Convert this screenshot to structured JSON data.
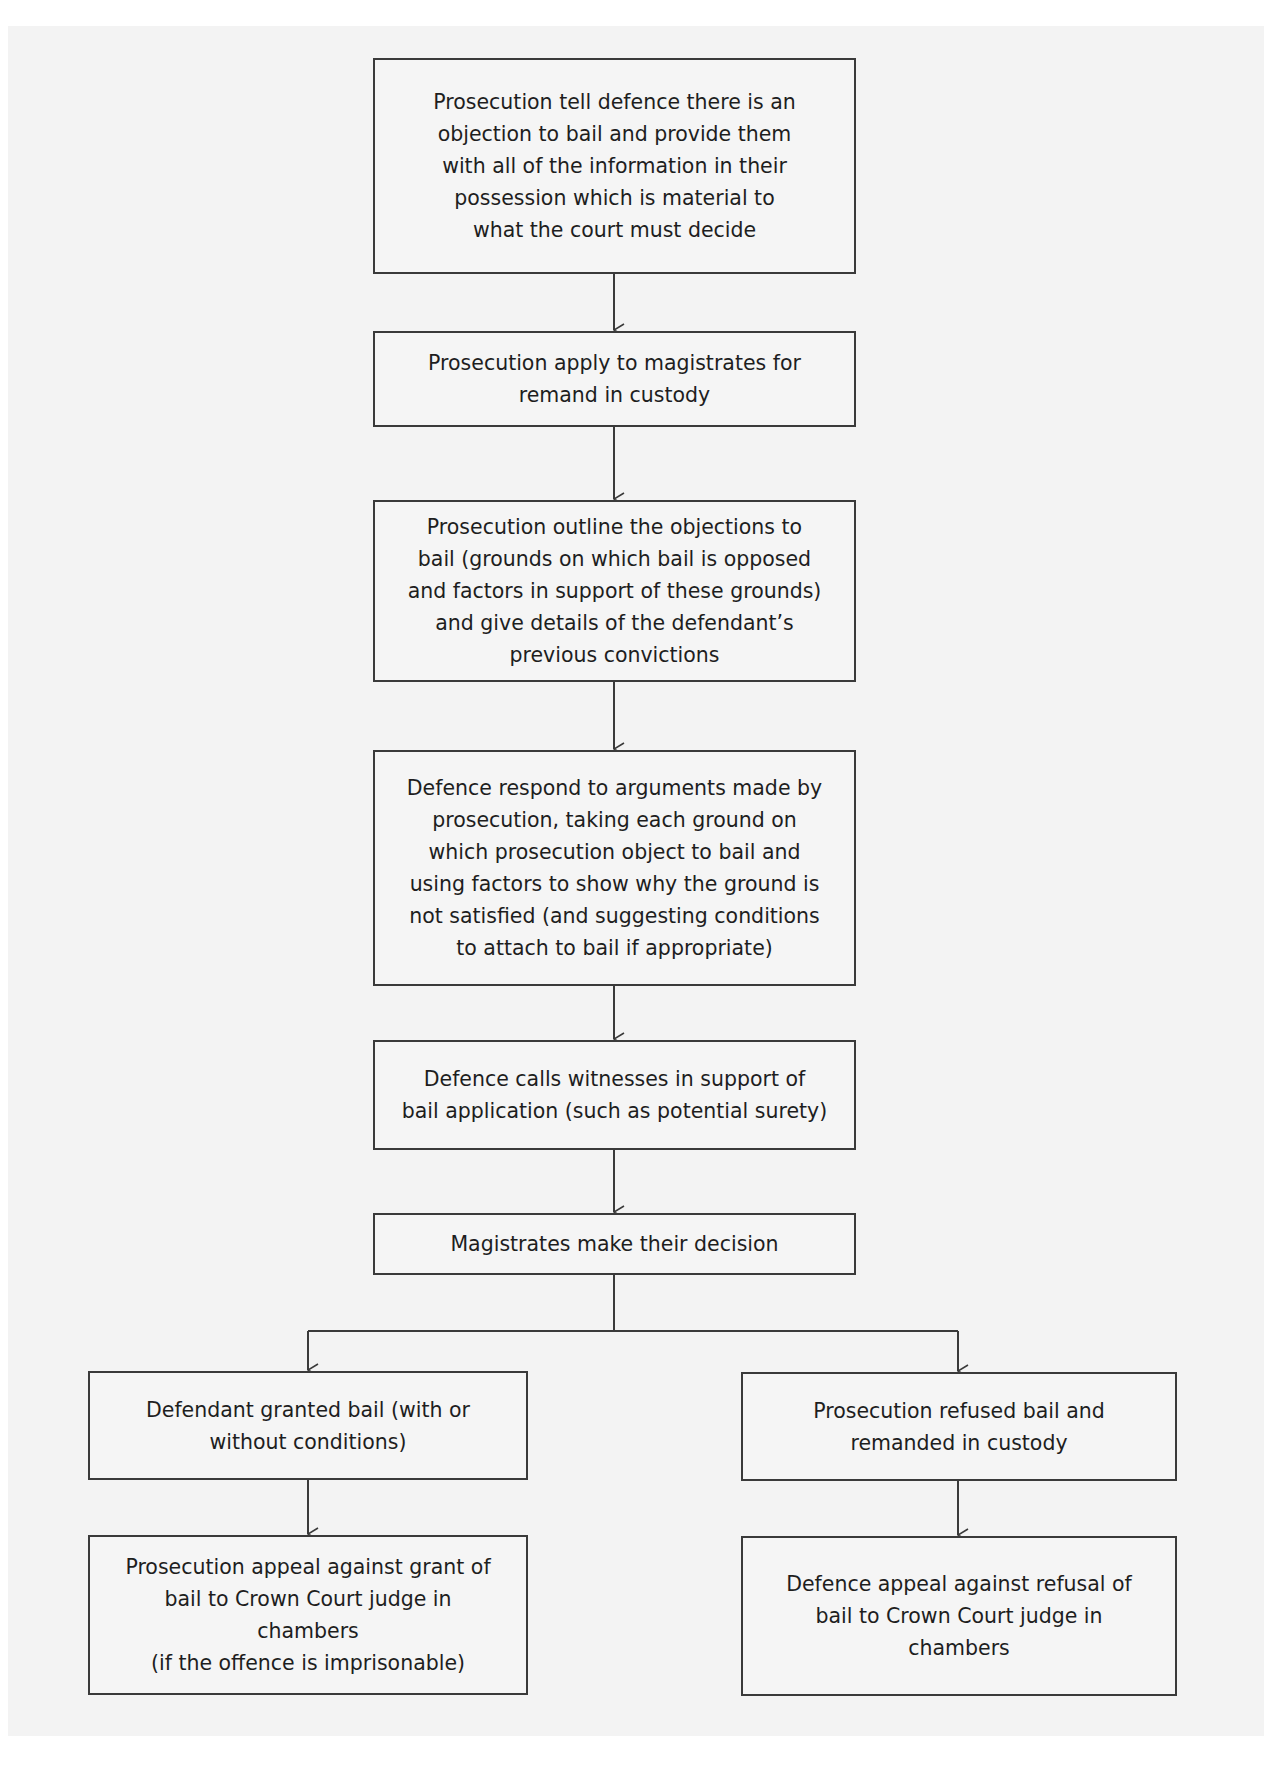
{
  "diagram": {
    "type": "flowchart",
    "nodes": [
      {
        "id": "n1",
        "text": "Prosecution tell defence there is an\nobjection to bail and provide them\nwith all of the information in their\npossession which is material to\nwhat the court must decide"
      },
      {
        "id": "n2",
        "text": "Prosecution apply to magistrates for\nremand in custody"
      },
      {
        "id": "n3",
        "text": "Prosecution outline the objections to\nbail (grounds on which bail is opposed\nand factors in support of these grounds)\nand give details of the defendant’s\nprevious convictions"
      },
      {
        "id": "n4",
        "text": "Defence respond to arguments made by\nprosecution, taking each ground on\nwhich prosecution object to bail and\nusing factors to show why the ground is\nnot satisfied (and suggesting conditions\nto attach to bail if appropriate)"
      },
      {
        "id": "n5",
        "text": "Defence calls witnesses in support of\nbail application (such as potential surety)"
      },
      {
        "id": "n6",
        "text": "Magistrates make their decision"
      },
      {
        "id": "n7",
        "text": "Defendant granted bail (with or\nwithout conditions)"
      },
      {
        "id": "n8",
        "text": "Prosecution refused bail and\nremanded in custody"
      },
      {
        "id": "n9",
        "text": "Prosecution appeal against grant of\nbail to Crown Court judge in\nchambers\n(if the offence is imprisonable)"
      },
      {
        "id": "n10",
        "text": "Defence appeal against refusal of\nbail to Crown Court judge in\nchambers"
      }
    ],
    "edges": [
      {
        "from": "n1",
        "to": "n2"
      },
      {
        "from": "n2",
        "to": "n3"
      },
      {
        "from": "n3",
        "to": "n4"
      },
      {
        "from": "n4",
        "to": "n5"
      },
      {
        "from": "n5",
        "to": "n6"
      },
      {
        "from": "n6",
        "to": "n7"
      },
      {
        "from": "n6",
        "to": "n8"
      },
      {
        "from": "n7",
        "to": "n9"
      },
      {
        "from": "n8",
        "to": "n10"
      }
    ],
    "colors": {
      "line": "#3a3a3a",
      "box_fill": "#f5f5f5",
      "text": "#1e1e1e",
      "background": "#f3f3f3"
    }
  }
}
